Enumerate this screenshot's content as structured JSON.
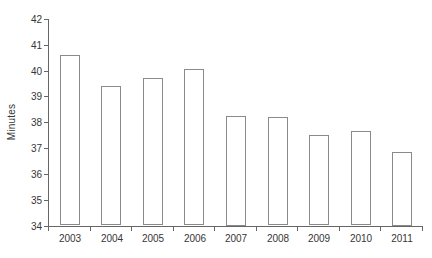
{
  "chart_data": {
    "type": "bar",
    "title": "",
    "xlabel": "",
    "ylabel": "Minutes",
    "categories": [
      "2003",
      "2004",
      "2005",
      "2006",
      "2007",
      "2008",
      "2009",
      "2010",
      "2011"
    ],
    "values": [
      40.6,
      39.4,
      39.7,
      40.05,
      38.25,
      38.2,
      37.5,
      37.65,
      36.85
    ],
    "ylim": [
      34,
      42
    ],
    "ytick_step": 1,
    "grid": false,
    "legend": false,
    "colors": {
      "background": "#ffffff",
      "bar_fill": "#ffffff",
      "bar_border": "#8a8a8a",
      "axis": "#666666",
      "text": "#363636"
    }
  }
}
